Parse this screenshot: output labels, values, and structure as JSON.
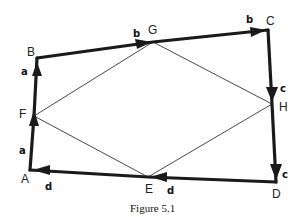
{
  "figure": {
    "caption": "Figure 5.1",
    "points": {
      "A": {
        "label": "A",
        "x": 30,
        "y": 170
      },
      "F": {
        "label": "F",
        "x": 34,
        "y": 116
      },
      "B": {
        "label": "B",
        "x": 37,
        "y": 58
      },
      "G": {
        "label": "G",
        "x": 153,
        "y": 42
      },
      "C": {
        "label": "C",
        "x": 268,
        "y": 30
      },
      "H": {
        "label": "H",
        "x": 272,
        "y": 104
      },
      "D": {
        "label": "D",
        "x": 276,
        "y": 182
      },
      "E": {
        "label": "E",
        "x": 148,
        "y": 177
      }
    },
    "vector_labels": {
      "AF": "a",
      "FB": "a",
      "BG": "b",
      "GC": "b",
      "CH": "c",
      "HD": "c",
      "DE": "d",
      "EA": "d"
    },
    "outer_path_order": [
      "A",
      "F",
      "B",
      "G",
      "C",
      "H",
      "D",
      "E",
      "A"
    ],
    "inner_quadrilateral": [
      "F",
      "G",
      "H",
      "E"
    ],
    "colors": {
      "stroke": "#1a1a1a",
      "background": "#ffffff"
    }
  }
}
